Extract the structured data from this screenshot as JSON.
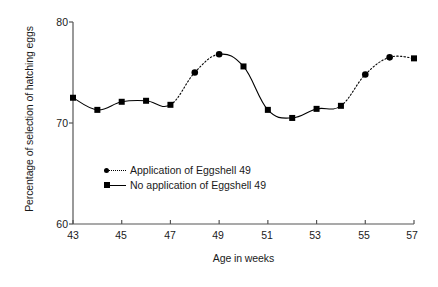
{
  "chart_data": {
    "type": "line",
    "title": "",
    "xlabel": "Age in weeks",
    "ylabel": "Percentage of selection of hatching eggs",
    "xlim": [
      43,
      57
    ],
    "ylim": [
      60,
      80
    ],
    "xticks": [
      43,
      45,
      47,
      49,
      51,
      53,
      55,
      57
    ],
    "yticks": [
      60,
      70,
      80
    ],
    "xtick_labels": [
      "43",
      "45",
      "47",
      "49",
      "51",
      "53",
      "55",
      "57"
    ],
    "ytick_labels": [
      "60",
      "70",
      "80"
    ],
    "grid": false,
    "legend_position": "center-left",
    "x": [
      43,
      44,
      45,
      46,
      47,
      48,
      49,
      50,
      51,
      52,
      53,
      54,
      55,
      56,
      57
    ],
    "values": [
      72.5,
      71.3,
      72.1,
      72.2,
      71.8,
      75.0,
      76.8,
      75.6,
      71.3,
      70.5,
      71.4,
      71.7,
      74.8,
      76.5,
      76.4
    ],
    "series": [
      {
        "name": "Application of Eggshell 49",
        "marker": "round",
        "linestyle": "dotted",
        "color": "#000000",
        "points": [
          {
            "x": 48,
            "y": 75.0
          },
          {
            "x": 49,
            "y": 76.8
          },
          {
            "x": 55,
            "y": 74.8
          },
          {
            "x": 56,
            "y": 76.5
          }
        ]
      },
      {
        "name": "No application of Eggshell 49",
        "marker": "square",
        "linestyle": "solid",
        "color": "#000000",
        "points": [
          {
            "x": 43,
            "y": 72.5
          },
          {
            "x": 44,
            "y": 71.3
          },
          {
            "x": 45,
            "y": 72.1
          },
          {
            "x": 46,
            "y": 72.2
          },
          {
            "x": 47,
            "y": 71.8
          },
          {
            "x": 50,
            "y": 75.6
          },
          {
            "x": 51,
            "y": 71.3
          },
          {
            "x": 52,
            "y": 70.5
          },
          {
            "x": 53,
            "y": 71.4
          },
          {
            "x": 54,
            "y": 71.7
          },
          {
            "x": 57,
            "y": 76.4
          }
        ]
      }
    ],
    "dotted_segments": [
      [
        47,
        48
      ],
      [
        48,
        49
      ],
      [
        54,
        55
      ],
      [
        55,
        56
      ],
      [
        56,
        57
      ]
    ]
  },
  "legend": {
    "items": [
      {
        "label": "Application of Eggshell 49",
        "style": "dotted",
        "marker": "round"
      },
      {
        "label": "No application of Eggshell 49",
        "style": "solid",
        "marker": "square"
      }
    ]
  }
}
